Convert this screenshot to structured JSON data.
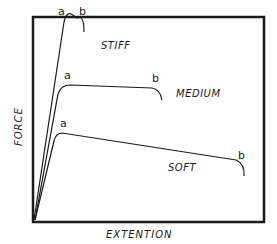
{
  "diagram": {
    "axes": {
      "x_label": "EXTENTION",
      "y_label": "FORCE"
    },
    "curves": [
      {
        "name": "STIFF",
        "point_a": "a",
        "point_b": "b"
      },
      {
        "name": "MEDIUM",
        "point_a": "a",
        "point_b": "b"
      },
      {
        "name": "SOFT",
        "point_a": "a",
        "point_b": "b"
      }
    ],
    "colors": {
      "ink": "#1a1a1a",
      "background": "#ffffff"
    }
  }
}
